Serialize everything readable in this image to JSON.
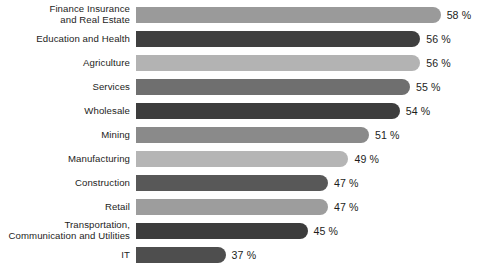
{
  "chart_data": {
    "type": "bar",
    "orientation": "horizontal",
    "title": "",
    "subtitle": "",
    "xlabel": "",
    "ylabel": "",
    "grid": false,
    "legend": null,
    "axis_truncated": true,
    "xlim": [
      28,
      60
    ],
    "value_suffix": "%",
    "categories": [
      "Finance Insurance\nand Real Estate",
      "Education and Health",
      "Agriculture",
      "Services",
      "Wholesale",
      "Mining",
      "Manufacturing",
      "Construction",
      "Retail",
      "Transportation,\nCommunication and Utilities",
      "IT"
    ],
    "values": [
      58,
      56,
      56,
      55,
      54,
      51,
      49,
      47,
      47,
      45,
      37
    ],
    "value_labels": [
      "58 %",
      "56 %",
      "56 %",
      "55 %",
      "54 %",
      "51 %",
      "49 %",
      "47 %",
      "47 %",
      "45 %",
      "37 %"
    ],
    "bar_colors": [
      "#9a9a9a",
      "#3f3f3f",
      "#b3b3b3",
      "#6f6f6f",
      "#3d3d3d",
      "#8a8a8a",
      "#b5b5b5",
      "#585858",
      "#9d9d9d",
      "#3c3c3c",
      "#4e4e4e"
    ]
  },
  "rows": [
    {
      "label": "Finance Insurance\nand Real Estate",
      "value_label": "58 %"
    },
    {
      "label": "Education and Health",
      "value_label": "56 %"
    },
    {
      "label": "Agriculture",
      "value_label": "56 %"
    },
    {
      "label": "Services",
      "value_label": "55 %"
    },
    {
      "label": "Wholesale",
      "value_label": "54 %"
    },
    {
      "label": "Mining",
      "value_label": "51 %"
    },
    {
      "label": "Manufacturing",
      "value_label": "49 %"
    },
    {
      "label": "Construction",
      "value_label": "47 %"
    },
    {
      "label": "Retail",
      "value_label": "47 %"
    },
    {
      "label": "Transportation,\nCommunication and Utilities",
      "value_label": "45 %"
    },
    {
      "label": "IT",
      "value_label": "37 %"
    }
  ]
}
